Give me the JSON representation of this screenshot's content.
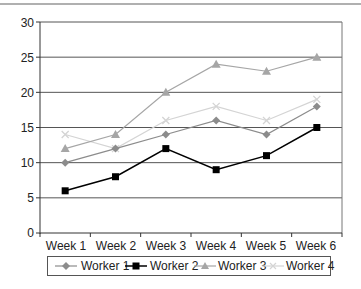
{
  "chart_data": {
    "type": "line",
    "title": "",
    "xlabel": "",
    "ylabel": "",
    "categories": [
      "Week 1",
      "Week 2",
      "Week 3",
      "Week 4",
      "Week 5",
      "Week 6"
    ],
    "ylim": [
      0,
      30
    ],
    "yticks": [
      0,
      5,
      10,
      15,
      20,
      25,
      30
    ],
    "grid": true,
    "legend_position": "bottom",
    "series": [
      {
        "name": "Worker 1",
        "marker": "diamond",
        "color": "#8c8c8c",
        "values": [
          10,
          12,
          14,
          16,
          14,
          18
        ]
      },
      {
        "name": "Worker 2",
        "marker": "square",
        "color": "#000000",
        "values": [
          6,
          8,
          12,
          9,
          11,
          15
        ]
      },
      {
        "name": "Worker 3",
        "marker": "triangle",
        "color": "#a6a6a6",
        "values": [
          12,
          14,
          20,
          24,
          23,
          25
        ]
      },
      {
        "name": "Worker 4",
        "marker": "x",
        "color": "#d4d4d4",
        "values": [
          14,
          12,
          16,
          18,
          16,
          19
        ]
      }
    ]
  },
  "axis": {
    "y_labels": [
      "0",
      "5",
      "10",
      "15",
      "20",
      "25",
      "30"
    ],
    "x_labels": [
      "Week 1",
      "Week 2",
      "Week 3",
      "Week 4",
      "Week 5",
      "Week 6"
    ]
  },
  "legend": {
    "items": [
      "Worker 1",
      "Worker 2",
      "Worker 3",
      "Worker 4"
    ]
  }
}
